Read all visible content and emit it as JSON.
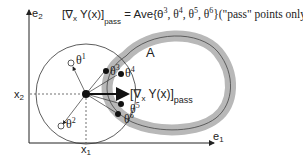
{
  "formula": {
    "lhs": "[∇",
    "lhs_sub_x": "x",
    "lhs_rest": " Y(x)]",
    "lhs_sub": "pass",
    "eq": " = Ave{θ",
    "t3": "3",
    "c1": ", θ",
    "t4": "4",
    "c2": ", θ",
    "t5": "5",
    "c3": ", θ",
    "t6": "6",
    "tail": "}(\"pass\" points only)"
  },
  "axes": {
    "y_label": "e",
    "y_sub": "2",
    "x_label": "e",
    "x_sub": "1",
    "x_tick": "x",
    "x_tick_sub": "1",
    "y_tick": "x",
    "y_tick_sub": "2"
  },
  "region": {
    "label": "A"
  },
  "gradient_label": {
    "main": "[∇",
    "sub_x": "x",
    "rest": " Y(x)]",
    "sub": "pass"
  },
  "points": [
    {
      "label": "θ",
      "sup": "1",
      "status": "fail"
    },
    {
      "label": "θ",
      "sup": "2",
      "status": "fail"
    },
    {
      "label": "θ",
      "sup": "3",
      "status": "pass"
    },
    {
      "label": "θ",
      "sup": "4",
      "status": "pass"
    },
    {
      "label": "θ",
      "sup": "5",
      "status": "pass"
    },
    {
      "label": "θ",
      "sup": "6",
      "status": "pass"
    }
  ],
  "colors": {
    "band": "#b8b8b8",
    "ink": "#222222"
  }
}
